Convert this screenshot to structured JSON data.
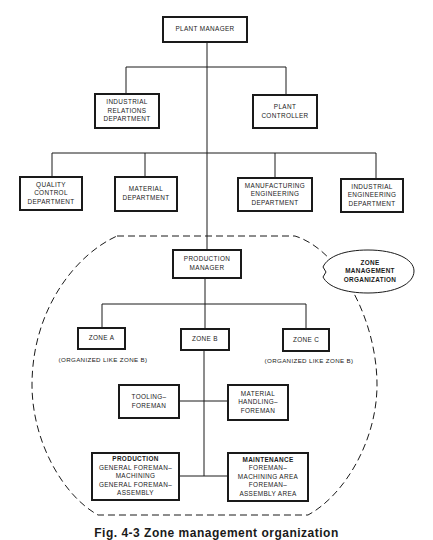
{
  "diagram": {
    "type": "organization-chart",
    "caption": "Fig. 4-3   Zone management organization",
    "nodes": {
      "plant_manager": {
        "lines": [
          "PLANT MANAGER"
        ]
      },
      "industrial_relations": {
        "lines": [
          "INDUSTRIAL",
          "RELATIONS",
          "DEPARTMENT"
        ]
      },
      "plant_controller": {
        "lines": [
          "PLANT",
          "CONTROLLER"
        ]
      },
      "quality_control": {
        "lines": [
          "QUALITY",
          "CONTROL",
          "DEPARTMENT"
        ]
      },
      "material": {
        "lines": [
          "MATERIAL",
          "DEPARTMENT"
        ]
      },
      "manufacturing_engineering": {
        "lines": [
          "MANUFACTURING",
          "ENGINEERING",
          "DEPARTMENT"
        ]
      },
      "industrial_engineering": {
        "lines": [
          "INDUSTRIAL",
          "ENGINEERING",
          "DEPARTMENT"
        ]
      },
      "production_manager": {
        "lines": [
          "PRODUCTION",
          "MANAGER"
        ]
      },
      "zone_a": {
        "lines": [
          "ZONE A"
        ],
        "note": "(ORGANIZED LIKE ZONE B)"
      },
      "zone_b": {
        "lines": [
          "ZONE B"
        ]
      },
      "zone_c": {
        "lines": [
          "ZONE C"
        ],
        "note": "(ORGANIZED LIKE ZONE B)"
      },
      "tooling_foreman": {
        "lines": [
          "TOOLING–",
          "FOREMAN"
        ]
      },
      "material_handling_foreman": {
        "lines": [
          "MATERIAL",
          "HANDLING–",
          "FOREMAN"
        ]
      },
      "production": {
        "heading": "PRODUCTION",
        "lines": [
          "GENERAL FOREMAN–",
          "MACHINING",
          "GENERAL FOREMAN–",
          "ASSEMBLY"
        ]
      },
      "maintenance": {
        "heading": "MAINTENANCE",
        "lines": [
          "FOREMAN–",
          "MACHINING AREA",
          "FOREMAN–",
          "ASSEMBLY AREA"
        ]
      }
    },
    "zone_group_label": {
      "lines": [
        "ZONE",
        "MANAGEMENT",
        "ORGANIZATION"
      ]
    },
    "edges": [
      [
        "plant_manager",
        "industrial_relations"
      ],
      [
        "plant_manager",
        "plant_controller"
      ],
      [
        "plant_manager",
        "quality_control"
      ],
      [
        "plant_manager",
        "material"
      ],
      [
        "plant_manager",
        "manufacturing_engineering"
      ],
      [
        "plant_manager",
        "industrial_engineering"
      ],
      [
        "plant_manager",
        "production_manager"
      ],
      [
        "production_manager",
        "zone_a"
      ],
      [
        "production_manager",
        "zone_b"
      ],
      [
        "production_manager",
        "zone_c"
      ],
      [
        "zone_b",
        "tooling_foreman"
      ],
      [
        "zone_b",
        "material_handling_foreman"
      ],
      [
        "zone_b",
        "production"
      ],
      [
        "zone_b",
        "maintenance"
      ]
    ],
    "colors": {
      "ink": "#1a1a1a",
      "background": "#ffffff"
    }
  }
}
